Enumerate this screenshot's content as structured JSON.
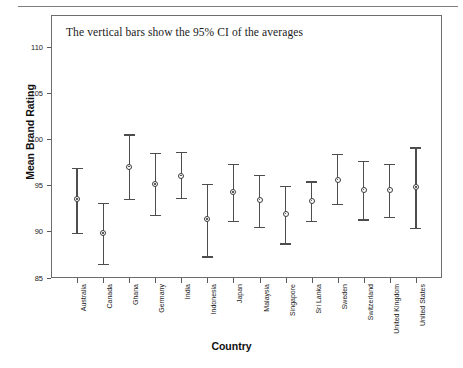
{
  "chart_data": {
    "type": "scatter",
    "title": "",
    "annotation": "The vertical bars show the 95% CI of the averages",
    "xlabel": "Country",
    "ylabel": "Mean Brand Rating",
    "ylim": [
      85,
      112
    ],
    "yticks": [
      85,
      90,
      95,
      100,
      105,
      110
    ],
    "grid": false,
    "legend": "none",
    "categories": [
      "Australia",
      "Canada",
      "Ghana",
      "Germany",
      "India",
      "Indonesia",
      "Japan",
      "Malaysia",
      "Singapore",
      "Sri Lanka",
      "Sweden",
      "Switzerland",
      "United Kingdom",
      "United States"
    ],
    "series": [
      {
        "name": "Mean Brand Rating",
        "values": [
          93.5,
          89.8,
          97.0,
          95.1,
          96.0,
          91.3,
          94.2,
          93.4,
          91.9,
          93.3,
          95.6,
          94.5,
          94.5,
          94.8
        ],
        "ci_lower": [
          89.8,
          86.5,
          93.5,
          91.8,
          93.6,
          87.3,
          91.1,
          90.5,
          88.7,
          91.1,
          93.0,
          91.3,
          91.6,
          90.4
        ],
        "ci_upper": [
          96.9,
          93.1,
          100.5,
          98.5,
          98.6,
          95.1,
          97.3,
          96.1,
          94.9,
          95.4,
          98.4,
          97.6,
          97.3,
          99.1
        ]
      }
    ]
  },
  "axis": {
    "ytick_labels": [
      "110",
      "105",
      "100",
      "95",
      "90",
      "85"
    ]
  }
}
